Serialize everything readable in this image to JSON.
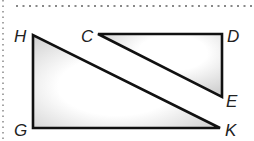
{
  "figure": {
    "type": "geometry-diagram",
    "triangles": [
      {
        "name": "HGK",
        "vertices": [
          "H",
          "G",
          "K"
        ],
        "right_angle_at": "G"
      },
      {
        "name": "CDE",
        "vertices": [
          "C",
          "D",
          "E"
        ],
        "right_angle_at": "D"
      }
    ],
    "labels": {
      "H": "H",
      "G": "G",
      "K": "K",
      "C": "C",
      "D": "D",
      "E": "E"
    },
    "colors": {
      "stroke": "#111111",
      "fill_light": "#ffffff",
      "fill_shade": "#d0d0d0",
      "border_dots": "#888888"
    }
  }
}
